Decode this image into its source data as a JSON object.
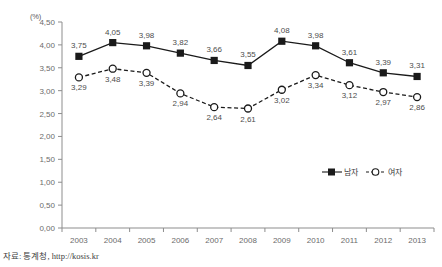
{
  "chart_data": {
    "type": "line",
    "title": "",
    "subtitle": "",
    "xlabel": "",
    "ylabel": "",
    "unit_label": "(%)",
    "categories": [
      "2003",
      "2004",
      "2005",
      "2006",
      "2007",
      "2008",
      "2009",
      "2010",
      "2011",
      "2012",
      "2013"
    ],
    "x": [
      2003,
      2004,
      2005,
      2006,
      2007,
      2008,
      2009,
      2010,
      2011,
      2012,
      2013
    ],
    "ylim": [
      0.0,
      4.5
    ],
    "ytick_labels": [
      "0,00",
      "0,50",
      "1,00",
      "1,50",
      "2,00",
      "2,50",
      "3,00",
      "3,50",
      "4,00",
      "4,50"
    ],
    "ytick_values": [
      0.0,
      0.5,
      1.0,
      1.5,
      2.0,
      2.5,
      3.0,
      3.5,
      4.0,
      4.5
    ],
    "grid": false,
    "legend_position": "inside-right",
    "decimal_separator": ",",
    "series": [
      {
        "name": "남자",
        "marker": "filled-square",
        "line_style": "solid",
        "color": "#1a1a1a",
        "values": [
          3.75,
          4.05,
          3.98,
          3.82,
          3.66,
          3.55,
          4.08,
          3.98,
          3.61,
          3.39,
          3.31
        ],
        "data_labels": [
          "3,75",
          "4,05",
          "3,98",
          "3,82",
          "3,66",
          "3,55",
          "4,08",
          "3,98",
          "3,61",
          "3,39",
          "3,31"
        ],
        "label_positions": [
          "above",
          "above",
          "above",
          "above",
          "above",
          "above",
          "above",
          "above",
          "above",
          "above",
          "above"
        ]
      },
      {
        "name": "여자",
        "marker": "open-circle",
        "line_style": "dashed",
        "color": "#1a1a1a",
        "values": [
          3.29,
          3.48,
          3.39,
          2.94,
          2.64,
          2.61,
          3.02,
          3.34,
          3.12,
          2.97,
          2.86
        ],
        "data_labels": [
          "3,29",
          "3,48",
          "3,39",
          "2,94",
          "2,64",
          "2,61",
          "3,02",
          "3,34",
          "3,12",
          "2,97",
          "2,86"
        ],
        "label_positions": [
          "below",
          "below",
          "below",
          "below",
          "below",
          "below",
          "below",
          "below",
          "below",
          "below",
          "below"
        ]
      }
    ]
  },
  "legend": {
    "items": [
      {
        "label": "남자",
        "marker": "filled-square"
      },
      {
        "label": "여자",
        "marker": "open-circle"
      }
    ]
  },
  "footer": {
    "source": "자료: 통계청, http://kosis.kr"
  }
}
